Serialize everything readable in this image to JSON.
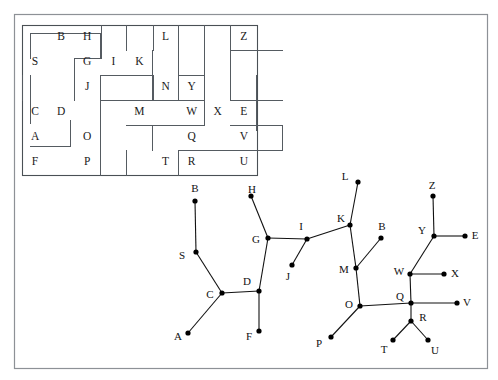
{
  "figure": {
    "title": "",
    "outer_frame": {
      "x": 14,
      "y": 14,
      "w": 474,
      "h": 355,
      "color": "#8d9196"
    }
  },
  "maze": {
    "name": "room-grid-maze",
    "frame": {
      "x": 22,
      "y": 25,
      "w": 235,
      "h": 150,
      "color": "#4a5055"
    },
    "grid": {
      "cols": 9,
      "rows": 6,
      "cell_w": 26.1,
      "cell_h": 25.0
    },
    "cells": [
      {
        "label": "S",
        "col": 0,
        "row": 1
      },
      {
        "label": "C",
        "col": 0,
        "row": 3
      },
      {
        "label": "A",
        "col": 0,
        "row": 4
      },
      {
        "label": "F",
        "col": 0,
        "row": 5
      },
      {
        "label": "B",
        "col": 1,
        "row": 0
      },
      {
        "label": "D",
        "col": 1,
        "row": 3
      },
      {
        "label": "H",
        "col": 2,
        "row": 0
      },
      {
        "label": "G",
        "col": 2,
        "row": 1
      },
      {
        "label": "J",
        "col": 2,
        "row": 2
      },
      {
        "label": "O",
        "col": 2,
        "row": 4
      },
      {
        "label": "P",
        "col": 2,
        "row": 5
      },
      {
        "label": "I",
        "col": 3,
        "row": 1
      },
      {
        "label": "K",
        "col": 4,
        "row": 1
      },
      {
        "label": "M",
        "col": 4,
        "row": 3
      },
      {
        "label": "L",
        "col": 5,
        "row": 0
      },
      {
        "label": "N",
        "col": 5,
        "row": 2
      },
      {
        "label": "T",
        "col": 5,
        "row": 5
      },
      {
        "label": "Y",
        "col": 6,
        "row": 2
      },
      {
        "label": "W",
        "col": 6,
        "row": 3
      },
      {
        "label": "Q",
        "col": 6,
        "row": 4
      },
      {
        "label": "R",
        "col": 6,
        "row": 5
      },
      {
        "label": "X",
        "col": 7,
        "row": 3
      },
      {
        "label": "Z",
        "col": 8,
        "row": 0
      },
      {
        "label": "E",
        "col": 8,
        "row": 3
      },
      {
        "label": "V",
        "col": 8,
        "row": 4
      },
      {
        "label": "U",
        "col": 8,
        "row": 5
      }
    ],
    "walls": [
      {
        "x1": 30,
        "y1": 33,
        "x2": 30,
        "y2": 58
      },
      {
        "x1": 30,
        "y1": 33,
        "x2": 100,
        "y2": 33
      },
      {
        "x1": 100,
        "y1": 33,
        "x2": 100,
        "y2": 58
      },
      {
        "x1": 74,
        "y1": 58,
        "x2": 100,
        "y2": 58
      },
      {
        "x1": 74,
        "y1": 58,
        "x2": 74,
        "y2": 100
      },
      {
        "x1": 101,
        "y1": 25,
        "x2": 101,
        "y2": 58
      },
      {
        "x1": 126,
        "y1": 25,
        "x2": 126,
        "y2": 50
      },
      {
        "x1": 153,
        "y1": 25,
        "x2": 153,
        "y2": 50
      },
      {
        "x1": 178,
        "y1": 25,
        "x2": 178,
        "y2": 50
      },
      {
        "x1": 100,
        "y1": 75,
        "x2": 100,
        "y2": 100
      },
      {
        "x1": 100,
        "y1": 75,
        "x2": 152,
        "y2": 75
      },
      {
        "x1": 152,
        "y1": 75,
        "x2": 152,
        "y2": 100
      },
      {
        "x1": 100,
        "y1": 100,
        "x2": 152,
        "y2": 100
      },
      {
        "x1": 100,
        "y1": 100,
        "x2": 100,
        "y2": 175
      },
      {
        "x1": 22,
        "y1": 75,
        "x2": 22,
        "y2": 100
      },
      {
        "x1": 30,
        "y1": 75,
        "x2": 30,
        "y2": 123
      },
      {
        "x1": 70,
        "y1": 120,
        "x2": 70,
        "y2": 146
      },
      {
        "x1": 30,
        "y1": 146,
        "x2": 70,
        "y2": 146
      },
      {
        "x1": 126,
        "y1": 100,
        "x2": 204,
        "y2": 100
      },
      {
        "x1": 178,
        "y1": 50,
        "x2": 178,
        "y2": 100
      },
      {
        "x1": 152,
        "y1": 50,
        "x2": 152,
        "y2": 75
      },
      {
        "x1": 153,
        "y1": 75,
        "x2": 153,
        "y2": 100
      },
      {
        "x1": 178,
        "y1": 75,
        "x2": 204,
        "y2": 75
      },
      {
        "x1": 204,
        "y1": 25,
        "x2": 204,
        "y2": 125
      },
      {
        "x1": 126,
        "y1": 125,
        "x2": 204,
        "y2": 125
      },
      {
        "x1": 152,
        "y1": 125,
        "x2": 152,
        "y2": 150
      },
      {
        "x1": 126,
        "y1": 150,
        "x2": 126,
        "y2": 175
      },
      {
        "x1": 178,
        "y1": 150,
        "x2": 178,
        "y2": 175
      },
      {
        "x1": 178,
        "y1": 150,
        "x2": 230,
        "y2": 150
      },
      {
        "x1": 230,
        "y1": 25,
        "x2": 230,
        "y2": 50
      },
      {
        "x1": 230,
        "y1": 50,
        "x2": 282,
        "y2": 50
      },
      {
        "x1": 230,
        "y1": 50,
        "x2": 230,
        "y2": 100
      },
      {
        "x1": 256,
        "y1": 75,
        "x2": 256,
        "y2": 130
      },
      {
        "x1": 230,
        "y1": 100,
        "x2": 282,
        "y2": 100
      },
      {
        "x1": 230,
        "y1": 125,
        "x2": 282,
        "y2": 125
      },
      {
        "x1": 282,
        "y1": 125,
        "x2": 282,
        "y2": 150
      },
      {
        "x1": 230,
        "y1": 150,
        "x2": 282,
        "y2": 150
      }
    ]
  },
  "graph": {
    "name": "tree-graph",
    "nodes": [
      {
        "label": "B",
        "x": 195,
        "y": 201,
        "lx": 195,
        "ly": 189
      },
      {
        "label": "S",
        "x": 196,
        "y": 252,
        "lx": 182,
        "ly": 256
      },
      {
        "label": "C",
        "x": 222,
        "y": 293,
        "lx": 210,
        "ly": 295
      },
      {
        "label": "A",
        "x": 188,
        "y": 333,
        "lx": 178,
        "ly": 337
      },
      {
        "label": "D",
        "x": 259,
        "y": 291,
        "lx": 247,
        "ly": 282
      },
      {
        "label": "F",
        "x": 259,
        "y": 331,
        "lx": 249,
        "ly": 337
      },
      {
        "label": "G",
        "x": 268,
        "y": 238,
        "lx": 256,
        "ly": 240
      },
      {
        "label": "H",
        "x": 251,
        "y": 196,
        "lx": 252,
        "ly": 190
      },
      {
        "label": "I",
        "x": 307,
        "y": 239,
        "lx": 301,
        "ly": 227
      },
      {
        "label": "J",
        "x": 292,
        "y": 265,
        "lx": 288,
        "ly": 277
      },
      {
        "label": "L",
        "x": 358,
        "y": 182,
        "lx": 345,
        "ly": 177
      },
      {
        "label": "K",
        "x": 350,
        "y": 225,
        "lx": 341,
        "ly": 219
      },
      {
        "label": "B2",
        "x": 381,
        "y": 238,
        "lx": 382,
        "ly": 227
      },
      {
        "label": "M",
        "x": 356,
        "y": 268,
        "lx": 344,
        "ly": 270
      },
      {
        "label": "O",
        "x": 360,
        "y": 306,
        "lx": 349,
        "ly": 305
      },
      {
        "label": "P",
        "x": 331,
        "y": 337,
        "lx": 319,
        "ly": 344
      },
      {
        "label": "Z",
        "x": 433,
        "y": 196,
        "lx": 432,
        "ly": 186
      },
      {
        "label": "Y",
        "x": 434,
        "y": 236,
        "lx": 422,
        "ly": 231
      },
      {
        "label": "E",
        "x": 465,
        "y": 236,
        "lx": 475,
        "ly": 236
      },
      {
        "label": "W",
        "x": 410,
        "y": 274,
        "lx": 399,
        "ly": 272
      },
      {
        "label": "X",
        "x": 444,
        "y": 274,
        "lx": 455,
        "ly": 274
      },
      {
        "label": "Q",
        "x": 411,
        "y": 303,
        "lx": 400,
        "ly": 297
      },
      {
        "label": "V",
        "x": 457,
        "y": 303,
        "lx": 467,
        "ly": 303
      },
      {
        "label": "R",
        "x": 411,
        "y": 321,
        "lx": 423,
        "ly": 318
      },
      {
        "label": "T",
        "x": 393,
        "y": 340,
        "lx": 384,
        "ly": 350
      },
      {
        "label": "U",
        "x": 428,
        "y": 340,
        "lx": 435,
        "ly": 351
      }
    ],
    "edges": [
      [
        "B",
        "S"
      ],
      [
        "S",
        "C"
      ],
      [
        "C",
        "A"
      ],
      [
        "C",
        "D"
      ],
      [
        "D",
        "F"
      ],
      [
        "D",
        "G"
      ],
      [
        "G",
        "H"
      ],
      [
        "G",
        "I"
      ],
      [
        "I",
        "J"
      ],
      [
        "I",
        "K"
      ],
      [
        "K",
        "L"
      ],
      [
        "K",
        "M"
      ],
      [
        "M",
        "B2"
      ],
      [
        "M",
        "O"
      ],
      [
        "O",
        "P"
      ],
      [
        "O",
        "Q"
      ],
      [
        "Q",
        "W"
      ],
      [
        "W",
        "Y"
      ],
      [
        "W",
        "X"
      ],
      [
        "Y",
        "Z"
      ],
      [
        "Y",
        "E"
      ],
      [
        "Q",
        "V"
      ],
      [
        "Q",
        "R"
      ],
      [
        "R",
        "T"
      ],
      [
        "R",
        "U"
      ]
    ],
    "node_radius": 2.6,
    "node_color": "#000000",
    "edge_color": "#111111"
  }
}
